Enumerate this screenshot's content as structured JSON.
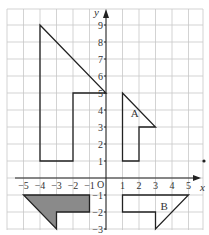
{
  "diagram": {
    "type": "coordinate-grid",
    "axes": {
      "x_label": "x",
      "y_label": "y",
      "origin_label": "O",
      "x_ticks": [
        "-5",
        "-4",
        "-3",
        "-2",
        "-1",
        "1",
        "2",
        "3",
        "4",
        "5"
      ],
      "y_ticks": [
        "-1",
        "-2",
        "-3",
        "1",
        "2",
        "3",
        "4",
        "5",
        "6",
        "7",
        "8",
        "9"
      ],
      "x_range": [
        -6,
        6
      ],
      "y_range": [
        -3,
        10
      ]
    },
    "shapes": [
      {
        "name": "large-L-shape",
        "label": "",
        "vertices": [
          [
            -4,
            9
          ],
          [
            0,
            5
          ],
          [
            -2,
            5
          ],
          [
            -2,
            1
          ],
          [
            -4,
            1
          ]
        ],
        "shaded": false
      },
      {
        "name": "shape-A",
        "label": "A",
        "vertices": [
          [
            1,
            5
          ],
          [
            3,
            3
          ],
          [
            2,
            3
          ],
          [
            2,
            1
          ],
          [
            1,
            1
          ]
        ],
        "shaded": false,
        "label_pos": [
          1.5,
          3.6
        ]
      },
      {
        "name": "shape-B",
        "label": "B",
        "vertices": [
          [
            1,
            -1
          ],
          [
            5,
            -1
          ],
          [
            3,
            -3
          ],
          [
            3,
            -2
          ],
          [
            1,
            -2
          ]
        ],
        "shaded": false,
        "label_pos": [
          3.3,
          -1.9
        ]
      },
      {
        "name": "shaded-shape",
        "label": "",
        "vertices": [
          [
            -5,
            -1
          ],
          [
            -1,
            -1
          ],
          [
            -1,
            -2
          ],
          [
            -3,
            -2
          ],
          [
            -3,
            -3
          ]
        ],
        "shaded": true
      }
    ],
    "point": {
      "name": "marker-dot",
      "pos": [
        6,
        1
      ]
    }
  }
}
